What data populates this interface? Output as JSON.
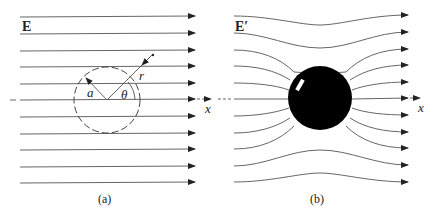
{
  "panels": [
    {
      "id": "a",
      "caption": "(a)",
      "field_label": "E",
      "axis_label": "x",
      "radius_label": "a",
      "r_label": "r",
      "angle_label": "θ",
      "description": "Uniform electric field lines with dashed circle of radius a"
    },
    {
      "id": "b",
      "caption": "(b)",
      "field_label": "E′",
      "axis_label": "x",
      "description": "Field lines distorted around a conducting/dielectric sphere"
    }
  ],
  "colors": {
    "line": "#555555",
    "sphere": "#000000",
    "background": "#ffffff"
  }
}
